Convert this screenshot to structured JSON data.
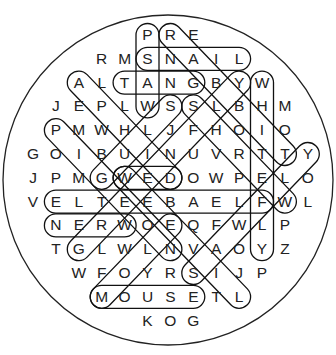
{
  "puzzle": {
    "type": "word-search",
    "shape": "circle",
    "grid_rows": [
      {
        "row": 0,
        "start_col": 5,
        "letters": "PRE"
      },
      {
        "row": 1,
        "start_col": 3,
        "letters": "RMSNAIL"
      },
      {
        "row": 2,
        "start_col": 2,
        "letters": "ALTANGBYW"
      },
      {
        "row": 3,
        "start_col": 1,
        "letters": "JEPLWSSLBHM"
      },
      {
        "row": 4,
        "start_col": 1,
        "letters": "PMWHLJFHOIO"
      },
      {
        "row": 5,
        "start_col": 0,
        "letters": "GOIBUINUVRTTY"
      },
      {
        "row": 6,
        "start_col": 0,
        "letters": "JPMGWEDOWPELO"
      },
      {
        "row": 7,
        "start_col": 0,
        "letters": "VELTEEBAELFWL"
      },
      {
        "row": 8,
        "start_col": 1,
        "letters": "NERWOEQFWLP"
      },
      {
        "row": 9,
        "start_col": 1,
        "letters": "TGLWLNVAOYZ"
      },
      {
        "row": 10,
        "start_col": 2,
        "letters": "WFOYRSIJP"
      },
      {
        "row": 11,
        "start_col": 3,
        "letters": "MOUSETL"
      },
      {
        "row": 12,
        "start_col": 5,
        "letters": "KOG"
      }
    ],
    "found_words": [
      {
        "word": "WASP",
        "start": [
          3,
          5
        ],
        "end": [
          0,
          5
        ]
      },
      {
        "word": "SNAIL",
        "start": [
          1,
          5
        ],
        "end": [
          1,
          9
        ]
      },
      {
        "word": "GNAT",
        "start": [
          2,
          7
        ],
        "end": [
          2,
          4
        ]
      },
      {
        "word": "RABBIT",
        "start": [
          0,
          6
        ],
        "end": [
          5,
          11
        ]
      },
      {
        "word": "WHITEFLY",
        "start": [
          2,
          10
        ],
        "end": [
          9,
          10
        ]
      },
      {
        "word": "SHREW",
        "start": [
          3,
          7
        ],
        "end": [
          7,
          11
        ]
      },
      {
        "word": "SLUG",
        "start": [
          3,
          6
        ],
        "end": [
          6,
          3
        ]
      },
      {
        "word": "APHID",
        "start": [
          2,
          2
        ],
        "end": [
          6,
          6
        ]
      },
      {
        "word": "PIGEON",
        "start": [
          4,
          1
        ],
        "end": [
          9,
          6
        ]
      },
      {
        "word": "DEW",
        "start": [
          6,
          6
        ],
        "end": [
          6,
          4
        ]
      },
      {
        "word": "FLEABEETLE",
        "start": [
          7,
          10
        ],
        "end": [
          7,
          1
        ]
      },
      {
        "word": "WREN",
        "start": [
          8,
          4
        ],
        "end": [
          8,
          1
        ]
      },
      {
        "word": "GREENFLY",
        "start": [
          9,
          2
        ],
        "end": [
          2,
          9
        ]
      },
      {
        "word": "MOLE",
        "start": [
          11,
          3
        ],
        "end": [
          8,
          6
        ]
      },
      {
        "word": "WEEVIL",
        "start": [
          6,
          4
        ],
        "end": [
          11,
          9
        ]
      },
      {
        "word": "SAWFLY",
        "start": [
          10,
          7
        ],
        "end": [
          5,
          12
        ]
      },
      {
        "word": "MOUSE",
        "start": [
          11,
          3
        ],
        "end": [
          11,
          7
        ]
      }
    ]
  },
  "colors": {
    "background": "#ffffff",
    "letters": "#222222",
    "outline": "#111111"
  }
}
